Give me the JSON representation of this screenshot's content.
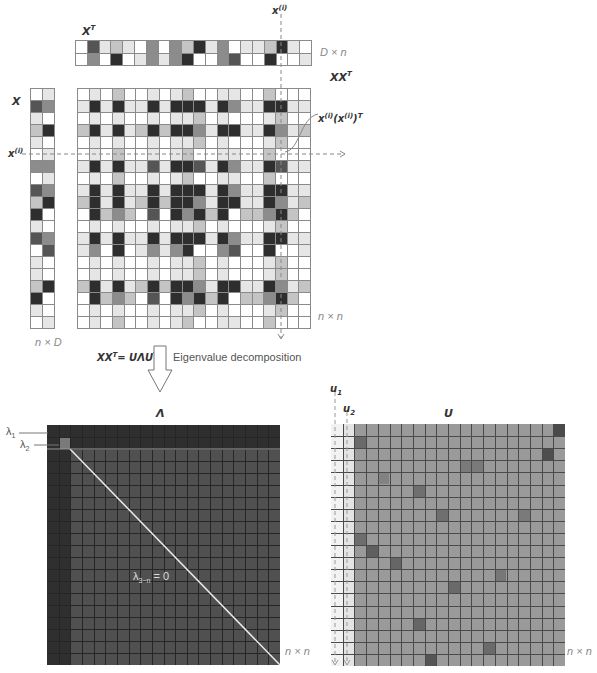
{
  "labels": {
    "xt": "X",
    "xt_sup": "T",
    "x": "X",
    "xxt": "XX",
    "xxt_sup": "T",
    "xi_top": "x",
    "xi_top_sup": "(i)",
    "xi_left": "x",
    "xi_left_sup": "(i)",
    "outer_product": "x",
    "outer_product_sup1": "(i)",
    "outer_product_mid": "(x",
    "outer_product_sup2": "(i)",
    "outer_product_end": ")",
    "outer_product_sup3": "T",
    "dim_xt": "D × n",
    "dim_x": "n × D",
    "dim_xxt": "n × n",
    "equation": "XX",
    "equation_sup": "T",
    "equation_rhs": "= UΛU",
    "equation_rhs_sup": "T",
    "decomposition": "Eigenvalue decomposition",
    "lambda_title": "Λ",
    "u_title": "U",
    "lambda1": "λ",
    "lambda1_sub": "1",
    "lambda2": "λ",
    "lambda2_sub": "2",
    "lambda_zero": "λ",
    "lambda_zero_sub": "3~n",
    "lambda_zero_rhs": " = 0",
    "u1": "u",
    "u1_sub": "1",
    "u2": "u",
    "u2_sub": "2",
    "dim_lambda": "n × n",
    "dim_u": "n × n"
  },
  "colors": {
    "white": "#ffffff",
    "light": "#e6e6e6",
    "mid_light": "#c4c4c4",
    "mid": "#8c8c8c",
    "dark": "#555555",
    "darkest": "#2e2e2e",
    "lambda_bg": "#505050",
    "lambda_dark": "#2f2f2f",
    "u_bg": "#9a9a9a",
    "grid_line": "#8a8a8a"
  },
  "matrices": {
    "xt": {
      "rows": 2,
      "cols": 20,
      "values": [
        [
          0,
          4,
          1,
          2,
          1,
          0,
          3,
          0,
          3,
          2,
          5,
          1,
          3,
          0,
          1,
          1,
          2,
          5,
          1,
          0
        ],
        [
          0,
          3,
          0,
          5,
          0,
          1,
          3,
          1,
          3,
          5,
          0,
          0,
          3,
          4,
          0,
          0,
          5,
          0,
          0,
          1
        ]
      ]
    },
    "x": {
      "rows": 20,
      "cols": 2,
      "values": [
        [
          0,
          1
        ],
        [
          4,
          3
        ],
        [
          1,
          0
        ],
        [
          2,
          5
        ],
        [
          1,
          0
        ],
        [
          0,
          1
        ],
        [
          3,
          3
        ],
        [
          0,
          1
        ],
        [
          4,
          3
        ],
        [
          2,
          5
        ],
        [
          5,
          0
        ],
        [
          1,
          0
        ],
        [
          4,
          3
        ],
        [
          0,
          4
        ],
        [
          1,
          0
        ],
        [
          1,
          0
        ],
        [
          2,
          5
        ],
        [
          5,
          0
        ],
        [
          1,
          0
        ],
        [
          0,
          1
        ]
      ]
    },
    "xxt": {
      "rows": 20,
      "cols": 20
    }
  }
}
